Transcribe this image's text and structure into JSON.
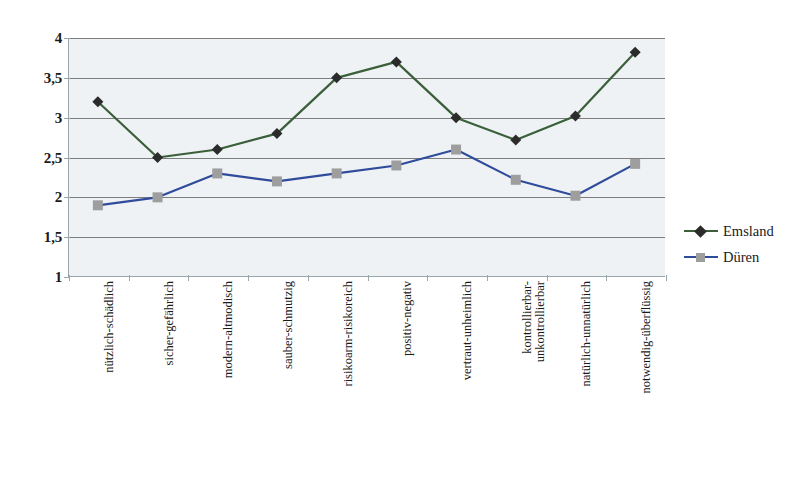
{
  "chart_data": {
    "type": "line",
    "title": "",
    "subtitle": "",
    "xlabel": "",
    "ylabel": "",
    "ylim": [
      1,
      4
    ],
    "yticks": [
      "1",
      "1,5",
      "2",
      "2,5",
      "3",
      "3,5",
      "4"
    ],
    "ytick_values": [
      1,
      1.5,
      2,
      2.5,
      3,
      3.5,
      4
    ],
    "grid": true,
    "legend_position": "right",
    "categories": [
      "nützlich-schädlich",
      "sicher-gefährlich",
      "modern-altmodisch",
      "sauber-schmutzig",
      "risikoarm-risikoreich",
      "positiv-negativ",
      "vertraut-unheimlich",
      "kontrollierbar-unkontrollierbar",
      "natürlich-unnatürlich",
      "notwendig-überflüssig"
    ],
    "category_lines": [
      [
        "nützlich-schädlich"
      ],
      [
        "sicher-gefährlich"
      ],
      [
        "modern-altmodisch"
      ],
      [
        "sauber-schmutzig"
      ],
      [
        "risikoarm-risikoreich"
      ],
      [
        "positiv-negativ"
      ],
      [
        "vertraut-unheimlich"
      ],
      [
        "kontrollierbar-",
        "unkontrollierbar"
      ],
      [
        "natürlich-unnatürlich"
      ],
      [
        "notwendig-überflüssig"
      ]
    ],
    "series": [
      {
        "name": "Emsland",
        "color": "#3a5f3a",
        "marker": "diamond",
        "marker_color": "#2b2b2b",
        "values": [
          3.2,
          2.5,
          2.6,
          2.8,
          3.5,
          3.7,
          3.0,
          2.72,
          3.02,
          3.82
        ]
      },
      {
        "name": "Düren",
        "color": "#2f4b9b",
        "marker": "square",
        "marker_color": "#9e9e9e",
        "values": [
          1.9,
          2.0,
          2.3,
          2.2,
          2.3,
          2.4,
          2.6,
          2.22,
          2.02,
          2.42
        ]
      }
    ]
  },
  "legend": {
    "items": [
      {
        "label": "Emsland"
      },
      {
        "label": "Düren"
      }
    ]
  },
  "colors": {
    "plot_background": "#eef2f4",
    "gridline": "#7d7d7d",
    "axis": "#9aa6ad",
    "emsland_line": "#3a5f3a",
    "emsland_marker": "#2b2b2b",
    "dueren_line": "#2f4b9b",
    "dueren_marker": "#9e9e9e"
  }
}
